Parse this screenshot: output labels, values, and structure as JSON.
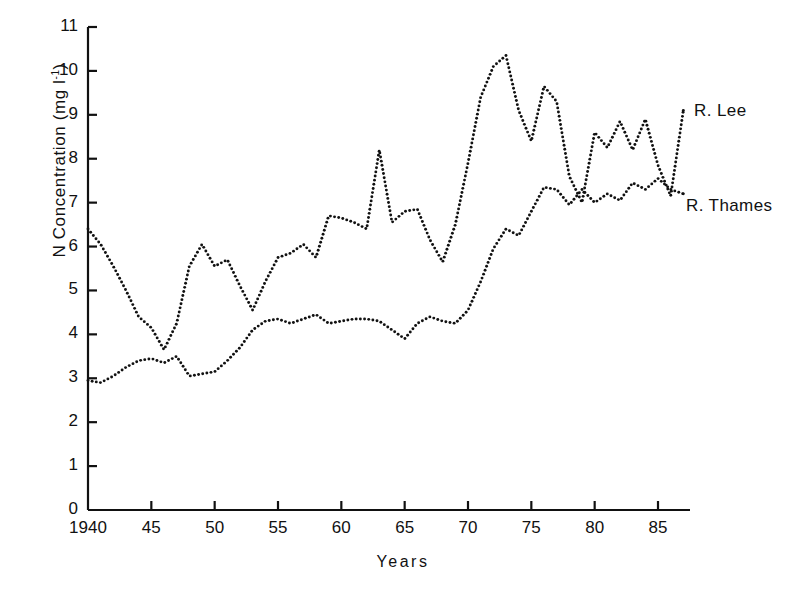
{
  "chart_data": {
    "type": "line",
    "title": "",
    "subtitle": "",
    "xlabel": "Years",
    "ylabel": "N Concentration (mg l",
    "ylabel_sup": "-1",
    "ylabel_tail": ")",
    "xlim": [
      1940,
      1987
    ],
    "ylim": [
      0,
      11
    ],
    "grid": false,
    "legend_position": "right-inline",
    "marker_style": "dotted",
    "yticks": [
      0,
      1,
      2,
      3,
      4,
      5,
      6,
      7,
      8,
      9,
      10,
      11
    ],
    "ytick_labels": [
      "0",
      "1",
      "2",
      "3",
      "4",
      "5",
      "6",
      "7",
      "8",
      "9",
      "10",
      "11"
    ],
    "xticks": [
      1940,
      1945,
      1950,
      1955,
      1960,
      1965,
      1970,
      1975,
      1980,
      1985
    ],
    "xtick_labels": [
      "1940",
      "45",
      "50",
      "55",
      "60",
      "65",
      "70",
      "75",
      "80",
      "85"
    ],
    "series": [
      {
        "name": "R. Lee",
        "label": "R. Lee",
        "color": "#111111",
        "x": [
          1940,
          1941,
          1942,
          1943,
          1944,
          1945,
          1946,
          1947,
          1948,
          1949,
          1950,
          1951,
          1952,
          1953,
          1954,
          1955,
          1956,
          1957,
          1958,
          1959,
          1960,
          1961,
          1962,
          1963,
          1964,
          1965,
          1966,
          1967,
          1968,
          1969,
          1970,
          1971,
          1972,
          1973,
          1974,
          1975,
          1976,
          1977,
          1978,
          1979,
          1980,
          1981,
          1982,
          1983,
          1984,
          1985,
          1986,
          1987
        ],
        "values": [
          6.4,
          6.05,
          5.55,
          5.0,
          4.4,
          4.15,
          3.65,
          4.25,
          5.55,
          6.05,
          5.55,
          5.7,
          5.1,
          4.55,
          5.2,
          5.75,
          5.85,
          6.05,
          5.75,
          6.7,
          6.65,
          6.55,
          6.4,
          8.2,
          6.55,
          6.8,
          6.85,
          6.15,
          5.65,
          6.5,
          7.9,
          9.4,
          10.1,
          10.35,
          9.1,
          8.4,
          9.65,
          9.3,
          7.6,
          7.0,
          8.6,
          8.25,
          8.85,
          8.2,
          8.9,
          7.85,
          7.15,
          9.1
        ]
      },
      {
        "name": "R. Thames",
        "label": "R. Thames",
        "color": "#111111",
        "x": [
          1940,
          1941,
          1942,
          1943,
          1944,
          1945,
          1946,
          1947,
          1948,
          1949,
          1950,
          1951,
          1952,
          1953,
          1954,
          1955,
          1956,
          1957,
          1958,
          1959,
          1960,
          1961,
          1962,
          1963,
          1964,
          1965,
          1966,
          1967,
          1968,
          1969,
          1970,
          1971,
          1972,
          1973,
          1974,
          1975,
          1976,
          1977,
          1978,
          1979,
          1980,
          1981,
          1982,
          1983,
          1984,
          1985,
          1986,
          1987
        ],
        "values": [
          2.95,
          2.9,
          3.05,
          3.25,
          3.4,
          3.45,
          3.35,
          3.5,
          3.05,
          3.1,
          3.15,
          3.4,
          3.7,
          4.1,
          4.3,
          4.35,
          4.25,
          4.35,
          4.45,
          4.25,
          4.3,
          4.35,
          4.35,
          4.3,
          4.1,
          3.9,
          4.25,
          4.4,
          4.3,
          4.25,
          4.55,
          5.2,
          5.95,
          6.4,
          6.25,
          6.8,
          7.35,
          7.3,
          6.95,
          7.3,
          7.0,
          7.2,
          7.05,
          7.45,
          7.3,
          7.55,
          7.3,
          7.2
        ]
      }
    ]
  },
  "axis": {
    "axis_color": "#111111"
  },
  "caption": {
    "text": ""
  }
}
